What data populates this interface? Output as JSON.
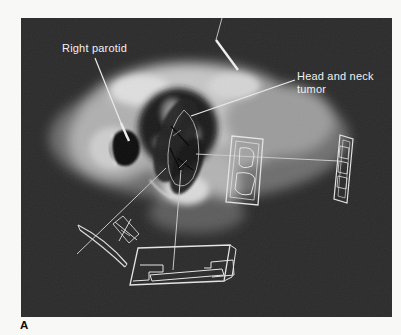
{
  "figure": {
    "panel_label": "A",
    "labels": {
      "parotid": "Right parotid",
      "tumor_line1": "Head and neck",
      "tumor_line2": "tumor"
    },
    "colors": {
      "page_background": "#f8f8f7",
      "image_background": "#2b2b2b",
      "annotation_text": "#f1f1f1",
      "wireframe": "#e6e6e6",
      "panel_label_text": "#0d0d0d"
    }
  }
}
